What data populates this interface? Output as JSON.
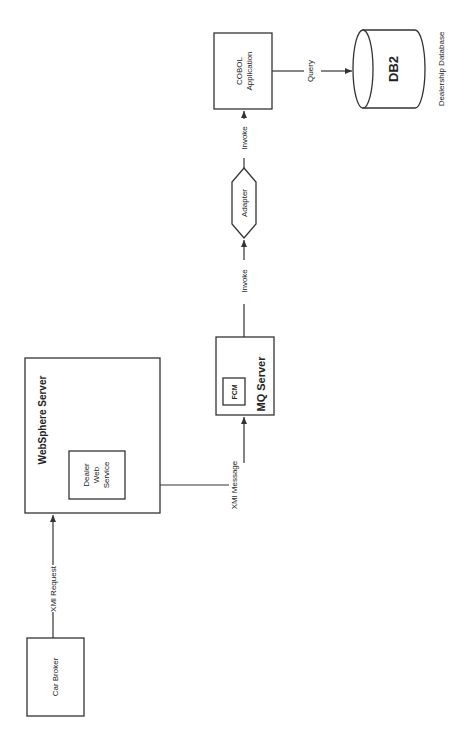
{
  "diagram": {
    "orientation": "rotated-90-ccw",
    "nodes": {
      "car_broker": {
        "label": "Car Broker"
      },
      "websphere": {
        "title": "WebSphere Server",
        "inner": {
          "line1": "Dealer",
          "line2": "Web",
          "line3": "Service"
        }
      },
      "mq_server": {
        "title": "MQ Server",
        "inner": {
          "label": "FCM"
        }
      },
      "adapter": {
        "label": "Adapter"
      },
      "cobol": {
        "line1": "COBOL",
        "line2": "Application"
      },
      "db2": {
        "label": "DB2",
        "caption": "Dealership Database"
      }
    },
    "edges": {
      "xml_request": {
        "label": "XMl Request"
      },
      "xml_message": {
        "label": "XMl Message"
      },
      "invoke_1": {
        "label": "Invoke"
      },
      "invoke_2": {
        "label": "Invoke"
      },
      "query": {
        "label": "Query"
      }
    },
    "colors": {
      "line": "#333333",
      "background": "#ffffff",
      "text": "#222222"
    }
  }
}
